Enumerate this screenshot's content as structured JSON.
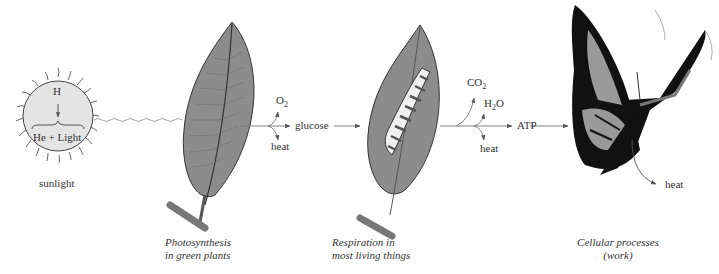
{
  "sun": {
    "top_label": "H",
    "bottom_label": "He + Light",
    "caption": "sunlight",
    "fill": "#e4e4e4"
  },
  "photosynthesis": {
    "outputs": {
      "o2": "O",
      "o2_sub": "2",
      "heat": "heat",
      "product": "glucose"
    },
    "caption_line1": "Photosynthesis",
    "caption_line2": "in green plants"
  },
  "respiration": {
    "outputs": {
      "co2": "CO",
      "co2_sub": "2",
      "h2o_a": "H",
      "h2o_sub": "2",
      "h2o_b": "O",
      "heat": "heat",
      "product": "ATP"
    },
    "caption_line1": "Respiration in",
    "caption_line2": "most living things"
  },
  "cellular": {
    "heat": "heat",
    "caption_line1": "Cellular processes",
    "caption_line2": "(work)"
  },
  "colors": {
    "leaf": "#8c8c8c",
    "leaf_edge": "#333333",
    "arrow": "#777777",
    "wing_fill": "#999999",
    "wing_black": "#111111"
  }
}
